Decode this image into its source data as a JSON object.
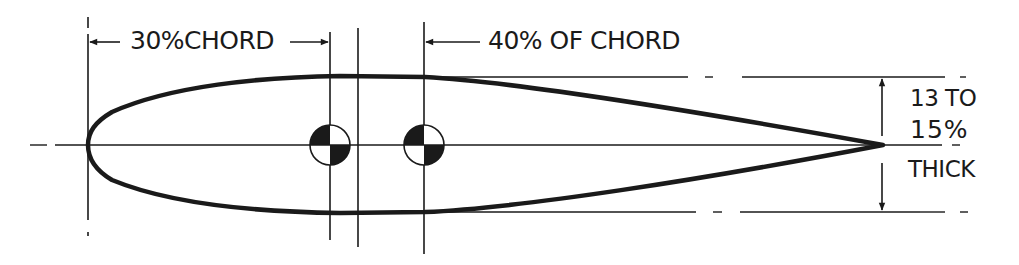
{
  "figure": {
    "ink_color": "#1a1a1a",
    "background_color": "#ffffff"
  },
  "annotations": {
    "cg_forward": "30%CHORD",
    "cg_aft": "40% OF CHORD",
    "thickness_line1": "13 TO",
    "thickness_line2": "15%",
    "thickness_line3": "THICK"
  },
  "symbols": [
    {
      "name": "center-of-gravity-forward",
      "x": 330,
      "y": 145
    },
    {
      "name": "center-of-gravity-aft",
      "x": 424,
      "y": 145
    }
  ],
  "geometry": {
    "leading_edge_x": 88,
    "trailing_edge_x": 883,
    "chord_line_y": 145,
    "upper_surface_y": 77,
    "lower_surface_y": 212
  }
}
